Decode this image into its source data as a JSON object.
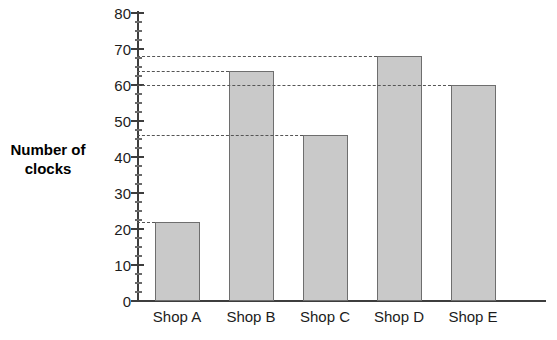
{
  "chart_data": {
    "type": "bar",
    "title": "",
    "xlabel": "",
    "ylabel": "Number of clocks",
    "categories": [
      "Shop A",
      "Shop B",
      "Shop C",
      "Shop D",
      "Shop E"
    ],
    "values": [
      22,
      64,
      46,
      68,
      60
    ],
    "ylim": [
      0,
      80
    ],
    "y_major_step": 10,
    "y_minor_step": 2.5,
    "y_tick_labels": [
      "80",
      "70",
      "60",
      "50",
      "40",
      "30",
      "20",
      "10",
      "0"
    ],
    "grid": false,
    "legend": null,
    "guide_lines": [
      68,
      64,
      60,
      46,
      22
    ],
    "bar_fill_color": "#c9c9c9",
    "bar_border_color": "#6e6e6e",
    "axis_color": "#3d3d3d",
    "guide_line_color": "#555555"
  },
  "axis_title": {
    "line1": "Number of",
    "line2": "clocks"
  }
}
